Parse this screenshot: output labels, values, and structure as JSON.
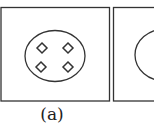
{
  "figure": {
    "panels": [
      {
        "id": "a",
        "caption": "(a)",
        "content": "ellipse containing four diamond markers arranged in a 2x2 grid",
        "marker_count": 4
      },
      {
        "id": "b",
        "caption": "",
        "content": "partially visible panel with circle outline (cropped)"
      }
    ],
    "colors": {
      "stroke": "#333333",
      "background": "#ffffff"
    }
  }
}
